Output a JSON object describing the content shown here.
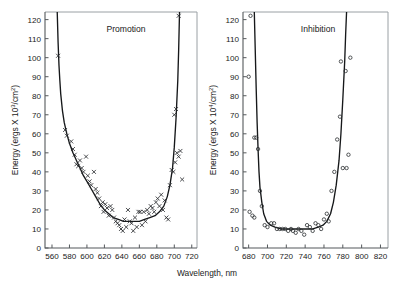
{
  "figure": {
    "xlabel": "Wavelength, nm",
    "background": "#ffffff",
    "curve_color": "#16181a",
    "marker_color": "#2a2d30",
    "axis_color": "#55595c"
  },
  "chart_data": [
    {
      "type": "scatter",
      "title": "Promotion",
      "xlabel": "Wavelength, nm",
      "ylabel_parts": {
        "pre": "Energy (ergs X 10",
        "exp": "3",
        "post": "/cm",
        "exp2": "2",
        "tail": ")"
      },
      "ylabel": "Energy (ergs X 10^3/cm^2)",
      "xlim": [
        552,
        726
      ],
      "ylim": [
        0,
        124
      ],
      "xticks": [
        560,
        580,
        600,
        620,
        640,
        660,
        680,
        700,
        720
      ],
      "yticks": [
        0,
        10,
        20,
        30,
        40,
        50,
        60,
        70,
        80,
        90,
        100,
        110,
        120
      ],
      "grid": false,
      "legend": "none",
      "marker": "x",
      "series": [
        {
          "name": "Promotion action spectrum",
          "marker": "x",
          "points": [
            [
              567,
              101
            ],
            [
              575,
              62
            ],
            [
              577,
              59
            ],
            [
              582,
              56
            ],
            [
              584,
              52
            ],
            [
              586,
              49
            ],
            [
              588,
              44
            ],
            [
              590,
              43
            ],
            [
              592,
              46
            ],
            [
              594,
              42
            ],
            [
              596,
              40
            ],
            [
              599,
              48
            ],
            [
              601,
              38
            ],
            [
              603,
              35
            ],
            [
              605,
              33
            ],
            [
              608,
              40
            ],
            [
              610,
              31
            ],
            [
              612,
              29
            ],
            [
              614,
              26
            ],
            [
              616,
              22
            ],
            [
              618,
              24
            ],
            [
              619,
              19
            ],
            [
              621,
              23
            ],
            [
              623,
              21
            ],
            [
              625,
              17
            ],
            [
              627,
              22
            ],
            [
              629,
              20
            ],
            [
              631,
              16
            ],
            [
              633,
              14
            ],
            [
              635,
              13
            ],
            [
              637,
              12
            ],
            [
              639,
              10
            ],
            [
              641,
              9
            ],
            [
              643,
              15
            ],
            [
              645,
              11
            ],
            [
              647,
              20
            ],
            [
              649,
              14
            ],
            [
              651,
              13
            ],
            [
              653,
              9
            ],
            [
              655,
              16
            ],
            [
              657,
              11
            ],
            [
              659,
              19
            ],
            [
              661,
              19
            ],
            [
              663,
              12
            ],
            [
              665,
              19
            ],
            [
              667,
              14
            ],
            [
              669,
              20
            ],
            [
              671,
              18
            ],
            [
              673,
              22
            ],
            [
              675,
              21
            ],
            [
              677,
              19
            ],
            [
              679,
              24
            ],
            [
              681,
              26
            ],
            [
              683,
              22
            ],
            [
              685,
              28
            ],
            [
              687,
              20
            ],
            [
              689,
              25
            ],
            [
              691,
              16
            ],
            [
              693,
              15
            ],
            [
              695,
              33
            ],
            [
              697,
              41
            ],
            [
              699,
              40
            ],
            [
              701,
              45
            ],
            [
              703,
              50
            ],
            [
              705,
              48
            ],
            [
              707,
              51
            ],
            [
              709,
              36
            ],
            [
              700,
              70
            ],
            [
              702,
              73
            ],
            [
              705,
              122
            ]
          ]
        }
      ],
      "fitted_curve": [
        [
          566,
          124
        ],
        [
          567,
          108
        ],
        [
          568,
          96
        ],
        [
          569,
          88
        ],
        [
          570,
          81
        ],
        [
          572,
          72
        ],
        [
          574,
          66
        ],
        [
          577,
          60
        ],
        [
          580,
          55
        ],
        [
          584,
          50
        ],
        [
          588,
          46
        ],
        [
          592,
          42
        ],
        [
          596,
          38
        ],
        [
          600,
          35
        ],
        [
          605,
          31
        ],
        [
          610,
          27
        ],
        [
          615,
          23
        ],
        [
          620,
          20
        ],
        [
          625,
          18
        ],
        [
          630,
          16
        ],
        [
          636,
          15
        ],
        [
          642,
          14
        ],
        [
          648,
          14
        ],
        [
          654,
          14
        ],
        [
          660,
          14
        ],
        [
          666,
          15
        ],
        [
          672,
          16
        ],
        [
          678,
          17
        ],
        [
          683,
          19
        ],
        [
          688,
          22
        ],
        [
          692,
          27
        ],
        [
          695,
          33
        ],
        [
          698,
          42
        ],
        [
          700,
          53
        ],
        [
          702,
          68
        ],
        [
          704,
          88
        ],
        [
          705,
          104
        ],
        [
          706,
          124
        ]
      ]
    },
    {
      "type": "scatter",
      "title": "Inhibition",
      "xlabel": "Wavelength, nm",
      "ylabel_parts": {
        "pre": "Energy (ergs X 10",
        "exp": "4",
        "post": "/cm",
        "exp2": "2",
        "tail": ")"
      },
      "ylabel": "Energy (ergs X 10^4/cm^2)",
      "xlim": [
        674,
        828
      ],
      "ylim": [
        0,
        124
      ],
      "xticks": [
        680,
        700,
        720,
        740,
        760,
        780,
        800,
        820
      ],
      "yticks": [
        0,
        10,
        20,
        30,
        40,
        50,
        60,
        70,
        80,
        90,
        100,
        110,
        120
      ],
      "grid": false,
      "legend": "none",
      "marker": "o",
      "series": [
        {
          "name": "Inhibition action spectrum",
          "marker": "o",
          "points": [
            [
              682,
              122
            ],
            [
              680,
              90
            ],
            [
              686,
              58
            ],
            [
              688,
              58
            ],
            [
              690,
              52
            ],
            [
              692,
              30
            ],
            [
              694,
              22
            ],
            [
              681,
              19
            ],
            [
              684,
              17
            ],
            [
              686,
              16
            ],
            [
              697,
              12
            ],
            [
              700,
              11
            ],
            [
              704,
              13
            ],
            [
              707,
              13
            ],
            [
              710,
              10
            ],
            [
              713,
              10
            ],
            [
              716,
              10
            ],
            [
              719,
              10
            ],
            [
              722,
              9
            ],
            [
              725,
              10
            ],
            [
              727,
              9
            ],
            [
              730,
              8
            ],
            [
              733,
              10
            ],
            [
              736,
              9
            ],
            [
              739,
              7
            ],
            [
              742,
              12
            ],
            [
              745,
              11
            ],
            [
              748,
              9
            ],
            [
              751,
              13
            ],
            [
              754,
              12
            ],
            [
              757,
              10
            ],
            [
              760,
              15
            ],
            [
              763,
              18
            ],
            [
              765,
              14
            ],
            [
              768,
              30
            ],
            [
              771,
              40
            ],
            [
              774,
              57
            ],
            [
              777,
              69
            ],
            [
              780,
              42
            ],
            [
              784,
              42
            ],
            [
              778,
              98
            ],
            [
              783,
              93
            ],
            [
              788,
              100
            ],
            [
              786,
              49
            ]
          ]
        }
      ],
      "fitted_curve": [
        [
          686,
          124
        ],
        [
          687,
          104
        ],
        [
          688,
          84
        ],
        [
          689,
          66
        ],
        [
          690,
          52
        ],
        [
          691,
          40
        ],
        [
          692,
          32
        ],
        [
          694,
          24
        ],
        [
          696,
          18
        ],
        [
          699,
          14
        ],
        [
          703,
          12
        ],
        [
          708,
          11
        ],
        [
          714,
          10
        ],
        [
          720,
          10
        ],
        [
          727,
          10
        ],
        [
          734,
          10
        ],
        [
          741,
          10
        ],
        [
          748,
          10
        ],
        [
          754,
          11
        ],
        [
          759,
          12
        ],
        [
          763,
          14
        ],
        [
          767,
          18
        ],
        [
          770,
          24
        ],
        [
          773,
          33
        ],
        [
          776,
          46
        ],
        [
          778,
          60
        ],
        [
          780,
          78
        ],
        [
          782,
          98
        ],
        [
          783,
          112
        ],
        [
          784,
          124
        ]
      ]
    }
  ]
}
